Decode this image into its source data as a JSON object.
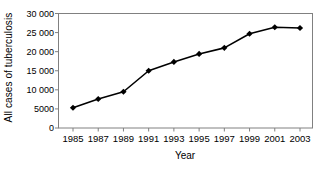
{
  "chart_data": {
    "type": "line",
    "title": "",
    "xlabel": "Year",
    "ylabel": "All cases of tuberculosis",
    "categories": [
      1985,
      1987,
      1989,
      1991,
      1993,
      1995,
      1997,
      1999,
      2001,
      2003
    ],
    "x_tick_labels": [
      "1985",
      "1987",
      "1989",
      "1991",
      "1993",
      "1995",
      "1997",
      "1999",
      "2001",
      "2003"
    ],
    "values": [
      5300,
      7600,
      9500,
      15000,
      17300,
      19400,
      21000,
      24700,
      26400,
      26200
    ],
    "y_tick_values": [
      0,
      5000,
      10000,
      15000,
      20000,
      25000,
      30000
    ],
    "y_tick_labels": [
      "0",
      "5000",
      "10 000",
      "15 000",
      "20 000",
      "25 000",
      "30 000"
    ],
    "ylim": [
      0,
      30000
    ],
    "xlim": [
      1984,
      2004
    ],
    "grid": false,
    "legend": null,
    "marker": "diamond",
    "series_color": "#000000",
    "frame_color": "#808080"
  }
}
